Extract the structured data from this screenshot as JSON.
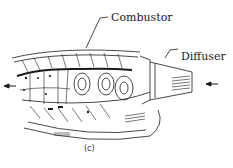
{
  "figure": {
    "caption": "(c)",
    "labels": {
      "combustor": "Combustor",
      "diffuser": "Diffuser"
    },
    "flow_arrows": {
      "inlet": "left-pointing arrow at right (airflow into diffuser)",
      "outlet": "left-pointing arrow at left (exhaust out of combustor)"
    },
    "colors": {
      "ink": "#1a1a1a",
      "background": "#ffffff"
    }
  }
}
